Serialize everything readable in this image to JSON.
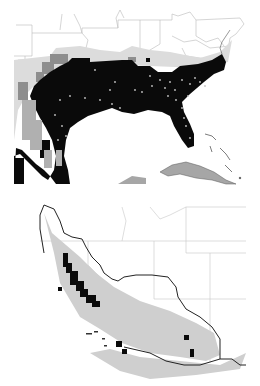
{
  "figure": {
    "panels": [
      {
        "id": "a",
        "region": "Southeastern United States, Gulf of Mexico, Cuba and Bahamas",
        "legend_classes": [
          {
            "name": "predicted-high",
            "color": "#0a0a0a"
          },
          {
            "name": "predicted-medium",
            "color": "#8c8c8c"
          },
          {
            "name": "predicted-low",
            "color": "#d2d2d2"
          },
          {
            "name": "background",
            "color": "#ffffff"
          }
        ],
        "occurrence_marker_color": "#bfbfbf",
        "state_border_color": "#b4b4b4"
      },
      {
        "id": "b",
        "region": "California and the desert Southwest",
        "legend_classes": [
          {
            "name": "predicted-high",
            "color": "#0a0a0a"
          },
          {
            "name": "predicted-low",
            "color": "#c8c8c8"
          },
          {
            "name": "background",
            "color": "#ffffff"
          }
        ],
        "range_outline_color": "#222222",
        "state_border_color": "#c8c8c8"
      }
    ],
    "caption": ""
  }
}
